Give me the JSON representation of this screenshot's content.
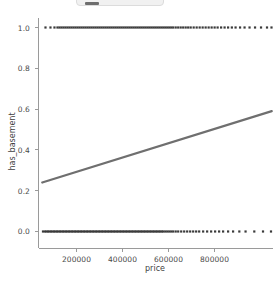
{
  "top_strip": {
    "name": "cropped-toolbar-strip",
    "color": "#f1f1f1"
  },
  "chart_data": {
    "type": "scatter",
    "title": "",
    "subtitle": "",
    "xlabel": "price",
    "ylabel": "has_basement",
    "xlim": [
      40000,
      980000
    ],
    "ylim": [
      -0.06,
      1.06
    ],
    "grid": false,
    "legend": null,
    "xticks": [
      200000,
      400000,
      600000,
      800000
    ],
    "xtick_labels": [
      "200000",
      "400000",
      "600000",
      "800000"
    ],
    "yticks": [
      0.0,
      0.2,
      0.4,
      0.6,
      0.8,
      1.0
    ],
    "ytick_labels": [
      "0.0",
      "0.2",
      "0.4",
      "0.6",
      "0.8",
      "1.0"
    ],
    "marker_color": "#3a3a3a",
    "line_color": "#6f6f6f",
    "axis_color": "#9a9a9a",
    "series": [
      {
        "name": "has_basement observations",
        "type": "scatter",
        "note": "binary response; points lie on y=0 and y=1 rows across the price range",
        "y_levels": [
          0.0,
          1.0
        ],
        "x_range": [
          55000,
          975000
        ],
        "points_y0_x": [
          58000,
          66000,
          72000,
          78000,
          84000,
          90000,
          96000,
          102000,
          108000,
          114000,
          120000,
          126000,
          132000,
          138000,
          144000,
          150000,
          156000,
          162000,
          168000,
          174000,
          180000,
          186000,
          192000,
          198000,
          204000,
          210000,
          216000,
          222000,
          228000,
          234000,
          240000,
          246000,
          252000,
          258000,
          264000,
          270000,
          276000,
          282000,
          288000,
          294000,
          300000,
          306000,
          312000,
          318000,
          324000,
          330000,
          336000,
          342000,
          348000,
          354000,
          360000,
          366000,
          372000,
          378000,
          384000,
          390000,
          396000,
          402000,
          408000,
          414000,
          420000,
          426000,
          432000,
          438000,
          444000,
          450000,
          456000,
          462000,
          468000,
          474000,
          480000,
          486000,
          492000,
          498000,
          504000,
          510000,
          516000,
          522000,
          528000,
          534000,
          540000,
          548000,
          556000,
          564000,
          572000,
          580000,
          590000,
          600000,
          612000,
          624000,
          636000,
          648000,
          660000,
          672000,
          684000,
          700000,
          716000,
          732000,
          748000,
          764000,
          780000,
          800000,
          820000,
          845000,
          870000,
          905000,
          940000,
          972000
        ],
        "points_y1_x": [
          68000,
          88000,
          104000,
          116000,
          124000,
          132000,
          140000,
          148000,
          156000,
          164000,
          172000,
          180000,
          188000,
          196000,
          204000,
          212000,
          220000,
          228000,
          236000,
          244000,
          252000,
          260000,
          268000,
          276000,
          284000,
          292000,
          300000,
          308000,
          316000,
          324000,
          332000,
          340000,
          348000,
          356000,
          364000,
          372000,
          380000,
          388000,
          396000,
          404000,
          412000,
          420000,
          428000,
          436000,
          444000,
          452000,
          460000,
          468000,
          476000,
          484000,
          492000,
          500000,
          508000,
          516000,
          524000,
          532000,
          540000,
          548000,
          556000,
          564000,
          572000,
          580000,
          590000,
          600000,
          610000,
          620000,
          630000,
          640000,
          650000,
          662000,
          674000,
          686000,
          698000,
          710000,
          722000,
          734000,
          746000,
          758000,
          772000,
          786000,
          800000,
          815000,
          830000,
          848000,
          866000,
          886000,
          908000,
          932000,
          956000,
          974000
        ]
      },
      {
        "name": "linear fit",
        "type": "line",
        "x": [
          55000,
          975000
        ],
        "y": [
          0.24,
          0.59
        ]
      }
    ]
  }
}
